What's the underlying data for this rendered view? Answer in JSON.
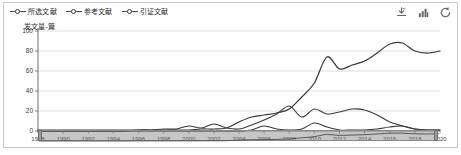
{
  "chart_data": {
    "type": "line",
    "title": "",
    "ylabel": "发文量-篇",
    "xlabel": "",
    "ylim": [
      0,
      100
    ],
    "yticks": [
      0,
      20,
      40,
      60,
      80,
      100
    ],
    "grid": true,
    "legend_position": "top-left",
    "xtick_labels": [
      "1988",
      "1990",
      "1992",
      "1994",
      "1996",
      "1998",
      "2000",
      "2002",
      "2004",
      "2006",
      "2008",
      "2010",
      "2012",
      "2014",
      "2016",
      "2018",
      "2020"
    ],
    "x": [
      1988,
      1989,
      1990,
      1991,
      1992,
      1993,
      1994,
      1995,
      1996,
      1997,
      1998,
      1999,
      2000,
      2001,
      2002,
      2003,
      2004,
      2005,
      2006,
      2007,
      2008,
      2009,
      2010,
      2011,
      2012,
      2013,
      2014,
      2015,
      2016,
      2017,
      2018,
      2019,
      2020
    ],
    "series": [
      {
        "name": "所选文献",
        "values": [
          0,
          0,
          0,
          0,
          0,
          0,
          0,
          0,
          0,
          0,
          0,
          0,
          0,
          0,
          0,
          0,
          0,
          1,
          5,
          2,
          1,
          2,
          8,
          4,
          1,
          1,
          1,
          2,
          4,
          5,
          2,
          1,
          1
        ]
      },
      {
        "name": "参考文献",
        "values": [
          1,
          1,
          1,
          1,
          1,
          1,
          1,
          1,
          1,
          1,
          2,
          2,
          5,
          3,
          7,
          3,
          2,
          6,
          11,
          17,
          25,
          14,
          22,
          17,
          19,
          22,
          21,
          16,
          9,
          5,
          2,
          1,
          1
        ]
      },
      {
        "name": "引证文献",
        "values": [
          0,
          0,
          0,
          0,
          0,
          0,
          0,
          0,
          1,
          1,
          1,
          1,
          1,
          2,
          2,
          3,
          9,
          14,
          16,
          18,
          22,
          34,
          48,
          74,
          62,
          66,
          70,
          78,
          87,
          88,
          80,
          78,
          80
        ]
      }
    ]
  },
  "legend": {
    "items": [
      {
        "label": "所选文献",
        "color": "#4a4a4a"
      },
      {
        "label": "参考文献",
        "color": "#4a4a4a"
      },
      {
        "label": "引证文献",
        "color": "#4a4a4a"
      }
    ]
  },
  "toolbar": {
    "export_label": "导出",
    "chart_type_label": "图表类型",
    "refresh_label": "刷新"
  },
  "range_selector": {
    "start": "1988",
    "end": "2020"
  }
}
